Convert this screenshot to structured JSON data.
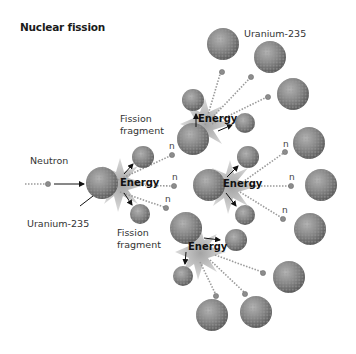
{
  "diagram": {
    "title": "Nuclear fission",
    "labels": {
      "neutron": "Neutron",
      "uranium_initial": "Uranium-235",
      "uranium_top": "Uranium-235",
      "fission_fragment_top_line1": "Fission",
      "fission_fragment_top_line2": "fragment",
      "fission_fragment_bottom_line1": "Fission",
      "fission_fragment_bottom_line2": "fragment",
      "energy_1": "Energy",
      "energy_2": "Energy",
      "energy_3": "Energy",
      "energy_4": "Energy",
      "neutron_symbol_1": "n",
      "neutron_symbol_2": "n",
      "neutron_symbol_3": "n",
      "neutron_symbol_4": "n",
      "neutron_symbol_5": "n",
      "neutron_symbol_6": "n",
      "neutron_symbol_7": "n"
    },
    "colors": {
      "nucleus": "#8a8a8a",
      "nucleus_dark": "#5e5e5e",
      "burst": "#b0b0b0",
      "text": "#333333"
    }
  }
}
